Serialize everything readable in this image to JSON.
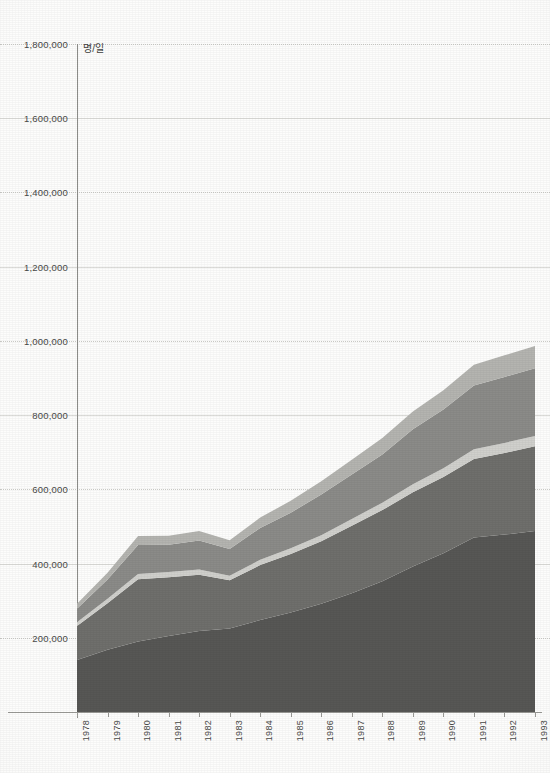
{
  "chart_data": {
    "type": "area",
    "stacked": true,
    "title": "",
    "subtitle": "",
    "xlabel": "",
    "ylabel": "",
    "unit_label": "명/일",
    "grid": true,
    "legend_position": "none",
    "ylim": [
      0,
      1800000
    ],
    "ytick_step": 200000,
    "ytick_labels": [
      "200,000",
      "400,000",
      "600,000",
      "800,000",
      "1,000,000",
      "1,200,000",
      "1,400,000",
      "1,600,000",
      "1,800,000"
    ],
    "ytick_values": [
      200000,
      400000,
      600000,
      800000,
      1000000,
      1200000,
      1400000,
      1600000,
      1800000
    ],
    "categories": [
      "1978",
      "1979",
      "1980",
      "1981",
      "1982",
      "1983",
      "1984",
      "1985",
      "1986",
      "1987",
      "1988",
      "1989",
      "1990",
      "1991",
      "1992",
      "1993"
    ],
    "x": [
      1978,
      1979,
      1980,
      1981,
      1982,
      1983,
      1984,
      1985,
      1986,
      1987,
      1988,
      1989,
      1990,
      1991,
      1992,
      1993
    ],
    "series": [
      {
        "name": "series-1",
        "color": "#575755",
        "values": [
          140000,
          168000,
          190000,
          205000,
          218000,
          225000,
          248000,
          268000,
          292000,
          320000,
          352000,
          392000,
          428000,
          470000,
          478000,
          488000
        ]
      },
      {
        "name": "series-2",
        "color": "#6f6f6c",
        "values": [
          92000,
          125000,
          168000,
          158000,
          152000,
          130000,
          148000,
          158000,
          168000,
          182000,
          192000,
          200000,
          205000,
          212000,
          220000,
          228000
        ]
      },
      {
        "name": "series-3",
        "color": "#d0d0cc",
        "values": [
          10000,
          12000,
          14000,
          14000,
          14000,
          12000,
          14000,
          15000,
          16000,
          18000,
          20000,
          22000,
          24000,
          26000,
          27000,
          28000
        ]
      },
      {
        "name": "series-4",
        "color": "#8b8b88",
        "values": [
          36000,
          52000,
          78000,
          74000,
          78000,
          72000,
          86000,
          96000,
          110000,
          120000,
          130000,
          148000,
          158000,
          172000,
          178000,
          182000
        ]
      },
      {
        "name": "series-5",
        "color": "#b4b4b0",
        "values": [
          14000,
          18000,
          24000,
          24000,
          26000,
          24000,
          28000,
          32000,
          36000,
          40000,
          44000,
          48000,
          52000,
          56000,
          58000,
          60000
        ]
      }
    ],
    "totals": [
      292000,
      375000,
      474000,
      475000,
      488000,
      463000,
      524000,
      569000,
      622000,
      680000,
      738000,
      810000,
      867000,
      936000,
      961000,
      986000
    ]
  },
  "axis": {
    "y_unit": "명/일"
  }
}
